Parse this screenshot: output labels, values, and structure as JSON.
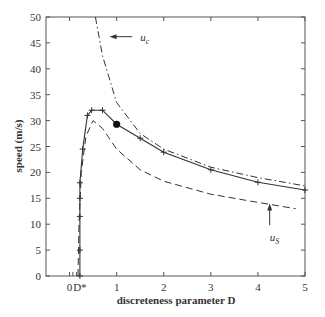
{
  "chart_data": {
    "type": "line",
    "title": "",
    "xlabel": "discreteness parameter  D",
    "ylabel": "speed (m/s)",
    "xlim": [
      -0.5,
      5
    ],
    "ylim": [
      0,
      50
    ],
    "grid": false,
    "x_ticks": [
      0,
      1,
      2,
      3,
      4,
      5
    ],
    "x_tick_labels": [
      "0",
      "1",
      "2",
      "3",
      "4",
      "5"
    ],
    "y_ticks": [
      0,
      5,
      10,
      15,
      20,
      25,
      30,
      35,
      40,
      45,
      50
    ],
    "y_tick_labels": [
      "0",
      "5",
      "10",
      "15",
      "20",
      "25",
      "30",
      "35",
      "40",
      "45",
      "50"
    ],
    "special_x_label": {
      "x": 0.22,
      "label": "D*"
    },
    "series": [
      {
        "name": "speed (computed)",
        "style": "solid-with-plus-markers",
        "x": [
          0.22,
          0.22,
          0.22,
          0.22,
          0.22,
          0.28,
          0.38,
          0.47,
          0.7,
          1.0,
          1.5,
          2.0,
          3.0,
          4.0,
          5.0
        ],
        "y": [
          0,
          5,
          11.5,
          15,
          18,
          24.5,
          31,
          32,
          32,
          29.3,
          26.6,
          23.9,
          20.5,
          18.1,
          16.6
        ]
      },
      {
        "name": "u_c",
        "style": "dash-dot",
        "x": [
          0.55,
          0.7,
          1.0,
          1.5,
          2.0,
          3.0,
          4.0,
          5.0
        ],
        "y": [
          50,
          42.5,
          33.5,
          27.5,
          24.5,
          21.0,
          19.0,
          17.4
        ]
      },
      {
        "name": "u_s",
        "style": "dashed",
        "x": [
          0.18,
          0.2,
          0.25,
          0.35,
          0.5,
          0.7,
          1.0,
          1.5,
          2.0,
          3.0,
          4.0,
          4.8
        ],
        "y": [
          0,
          10,
          20,
          27,
          30,
          28.5,
          24.5,
          20.5,
          18.3,
          15.8,
          14.2,
          13.0
        ]
      }
    ],
    "highlight_point": {
      "x": 1.0,
      "y": 29.3
    },
    "annotations": [
      {
        "text": "u",
        "subscript": "c",
        "arrow_to": {
          "x": 0.85,
          "y": 46.2
        },
        "text_pos": {
          "x": 1.5,
          "y": 46.2
        }
      },
      {
        "text": "u",
        "subscript": "S",
        "arrow_to": {
          "x": 4.25,
          "y": 14.0
        },
        "text_pos": {
          "x": 4.25,
          "y": 7.5
        }
      }
    ]
  }
}
